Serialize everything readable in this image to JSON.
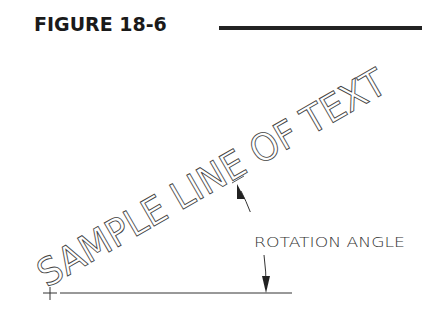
{
  "figure": {
    "title": "FIGURE 18-6"
  },
  "drawing": {
    "rotated_text": "SAMPLE LINE OF TEXT",
    "rotation_degrees": 30,
    "dimension_label": "ROTATION ANGLE",
    "colors": {
      "line": "#333333",
      "background": "#ffffff"
    }
  }
}
